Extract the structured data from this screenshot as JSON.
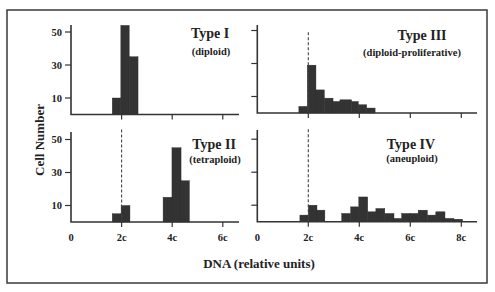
{
  "figure": {
    "ylabel": "Cell Number",
    "xlabel": "DNA (relative units)"
  },
  "panels": [
    {
      "title": "Type I",
      "subtitle": "(diploid)"
    },
    {
      "title": "Type III",
      "subtitle": "(diploid-proliferative)"
    },
    {
      "title": "Type II",
      "subtitle": "(tetraploid)"
    },
    {
      "title": "Type IV",
      "subtitle": "(aneuploid)"
    }
  ],
  "chart_data": [
    {
      "type": "bar",
      "title": "Type I",
      "subtitle": "(diploid)",
      "xlabel": "DNA (relative units)",
      "ylabel": "Cell Number",
      "xlim": [
        0,
        6.7
      ],
      "ylim": [
        0,
        55
      ],
      "xticks": [
        {
          "value": 0,
          "label": "0"
        },
        {
          "value": 2,
          "label": "2c"
        },
        {
          "value": 4,
          "label": "4c"
        },
        {
          "value": 6,
          "label": "6c"
        }
      ],
      "yticks": [
        {
          "value": 10,
          "label": "10"
        },
        {
          "value": 30,
          "label": "30"
        },
        {
          "value": 50,
          "label": "50"
        }
      ],
      "show_xtick_labels": false,
      "show_ytick_labels": true,
      "reference_line": null,
      "bins": [
        {
          "x0": 1.63,
          "x1": 1.97,
          "count": 10
        },
        {
          "x0": 1.97,
          "x1": 2.3,
          "count": 54
        },
        {
          "x0": 2.3,
          "x1": 2.65,
          "count": 35
        }
      ]
    },
    {
      "type": "bar",
      "title": "Type III",
      "subtitle": "(diploid-proliferative)",
      "xlabel": "DNA (relative units)",
      "ylabel": "Cell Number",
      "xlim": [
        0,
        8.6
      ],
      "ylim": [
        0,
        55
      ],
      "xticks": [
        {
          "value": 0,
          "label": "0"
        },
        {
          "value": 2,
          "label": "2c"
        },
        {
          "value": 4,
          "label": "4c"
        },
        {
          "value": 6,
          "label": "6c"
        },
        {
          "value": 8,
          "label": "8c"
        }
      ],
      "yticks": [
        {
          "value": 10,
          "label": "10"
        },
        {
          "value": 30,
          "label": "30"
        },
        {
          "value": 50,
          "label": "50"
        }
      ],
      "show_xtick_labels": false,
      "show_ytick_labels": false,
      "reference_line": {
        "x": 2,
        "top": 49
      },
      "bins": [
        {
          "x0": 1.63,
          "x1": 1.96,
          "count": 4
        },
        {
          "x0": 1.96,
          "x1": 2.3,
          "count": 29
        },
        {
          "x0": 2.3,
          "x1": 2.63,
          "count": 14
        },
        {
          "x0": 2.63,
          "x1": 2.97,
          "count": 9
        },
        {
          "x0": 2.97,
          "x1": 3.24,
          "count": 7
        },
        {
          "x0": 3.24,
          "x1": 3.7,
          "count": 8
        },
        {
          "x0": 3.7,
          "x1": 3.96,
          "count": 7
        },
        {
          "x0": 3.96,
          "x1": 4.29,
          "count": 5
        },
        {
          "x0": 4.29,
          "x1": 4.62,
          "count": 3
        }
      ]
    },
    {
      "type": "bar",
      "title": "Type II",
      "subtitle": "(tetraploid)",
      "xlabel": "DNA (relative units)",
      "ylabel": "Cell Number",
      "xlim": [
        0,
        6.7
      ],
      "ylim": [
        0,
        55
      ],
      "xticks": [
        {
          "value": 0,
          "label": "0"
        },
        {
          "value": 2,
          "label": "2c"
        },
        {
          "value": 4,
          "label": "4c"
        },
        {
          "value": 6,
          "label": "6c"
        }
      ],
      "yticks": [
        {
          "value": 10,
          "label": "10"
        },
        {
          "value": 30,
          "label": "30"
        },
        {
          "value": 50,
          "label": "50"
        }
      ],
      "show_xtick_labels": true,
      "show_ytick_labels": true,
      "reference_line": {
        "x": 2,
        "top": 56
      },
      "bins": [
        {
          "x0": 1.63,
          "x1": 1.98,
          "count": 5
        },
        {
          "x0": 1.98,
          "x1": 2.33,
          "count": 10
        },
        {
          "x0": 3.64,
          "x1": 3.99,
          "count": 15
        },
        {
          "x0": 3.99,
          "x1": 4.35,
          "count": 45
        },
        {
          "x0": 4.35,
          "x1": 4.68,
          "count": 25
        }
      ]
    },
    {
      "type": "bar",
      "title": "Type IV",
      "subtitle": "(aneuploid)",
      "xlabel": "DNA (relative units)",
      "ylabel": "Cell Number",
      "xlim": [
        0,
        8.6
      ],
      "ylim": [
        0,
        55
      ],
      "xticks": [
        {
          "value": 0,
          "label": "0"
        },
        {
          "value": 2,
          "label": "2c"
        },
        {
          "value": 4,
          "label": "4c"
        },
        {
          "value": 6,
          "label": "6c"
        },
        {
          "value": 8,
          "label": "8c"
        }
      ],
      "yticks": [
        {
          "value": 10,
          "label": "10"
        },
        {
          "value": 30,
          "label": "30"
        },
        {
          "value": 50,
          "label": "50"
        }
      ],
      "show_xtick_labels": true,
      "show_ytick_labels": false,
      "reference_line": {
        "x": 2,
        "top": 56
      },
      "bins": [
        {
          "x0": 1.67,
          "x1": 2.0,
          "count": 4
        },
        {
          "x0": 2.0,
          "x1": 2.34,
          "count": 10
        },
        {
          "x0": 2.34,
          "x1": 2.65,
          "count": 7
        },
        {
          "x0": 3.31,
          "x1": 3.66,
          "count": 5
        },
        {
          "x0": 3.66,
          "x1": 3.98,
          "count": 9
        },
        {
          "x0": 3.98,
          "x1": 4.33,
          "count": 15
        },
        {
          "x0": 4.33,
          "x1": 4.65,
          "count": 6
        },
        {
          "x0": 4.65,
          "x1": 5.0,
          "count": 8
        },
        {
          "x0": 5.0,
          "x1": 5.36,
          "count": 5
        },
        {
          "x0": 5.36,
          "x1": 5.66,
          "count": 2
        },
        {
          "x0": 5.66,
          "x1": 5.99,
          "count": 5
        },
        {
          "x0": 5.99,
          "x1": 6.31,
          "count": 5
        },
        {
          "x0": 6.31,
          "x1": 6.67,
          "count": 7
        },
        {
          "x0": 6.67,
          "x1": 7.0,
          "count": 4
        },
        {
          "x0": 7.0,
          "x1": 7.36,
          "count": 6
        },
        {
          "x0": 7.36,
          "x1": 7.71,
          "count": 2
        },
        {
          "x0": 7.71,
          "x1": 8.05,
          "count": 1.5
        }
      ]
    }
  ]
}
